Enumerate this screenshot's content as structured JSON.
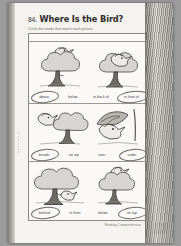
{
  "worksheet": {
    "number": "84.",
    "title": "Where Is the Bird?",
    "instructions": "Circle the words that match each picture.",
    "footer": "Reading Comprehension",
    "page_number": "93",
    "spine_note": "Where Is the Bird?"
  },
  "rows": [
    {
      "id": "row-1",
      "left_picture": "bird-flying-above-tree",
      "right_picture": "bird-in-front-of-tree",
      "labels": [
        {
          "text": "above",
          "circled": true
        },
        {
          "text": "below",
          "circled": false
        },
        {
          "text": "in back of",
          "circled": false
        },
        {
          "text": "in front of",
          "circled": true
        }
      ]
    },
    {
      "id": "row-2",
      "left_picture": "bird-beside-tree",
      "right_picture": "bird-under-leaf",
      "labels": [
        {
          "text": "beside",
          "circled": true
        },
        {
          "text": "on top",
          "circled": false
        },
        {
          "text": "over",
          "circled": false
        },
        {
          "text": "under",
          "circled": true
        }
      ]
    },
    {
      "id": "row-3",
      "left_picture": "bird-behind-tree",
      "right_picture": "bird-on-top-of-tree",
      "labels": [
        {
          "text": "behind",
          "circled": true
        },
        {
          "text": "in front",
          "circled": false
        },
        {
          "text": "below",
          "circled": false
        },
        {
          "text": "on top",
          "circled": true
        }
      ]
    }
  ],
  "colors": {
    "page": "#f5f3f0",
    "ink": "#2e2c2a",
    "pencil": "#55524e",
    "leaf": "#d7d5d1",
    "trunk": "#6e6b66"
  }
}
